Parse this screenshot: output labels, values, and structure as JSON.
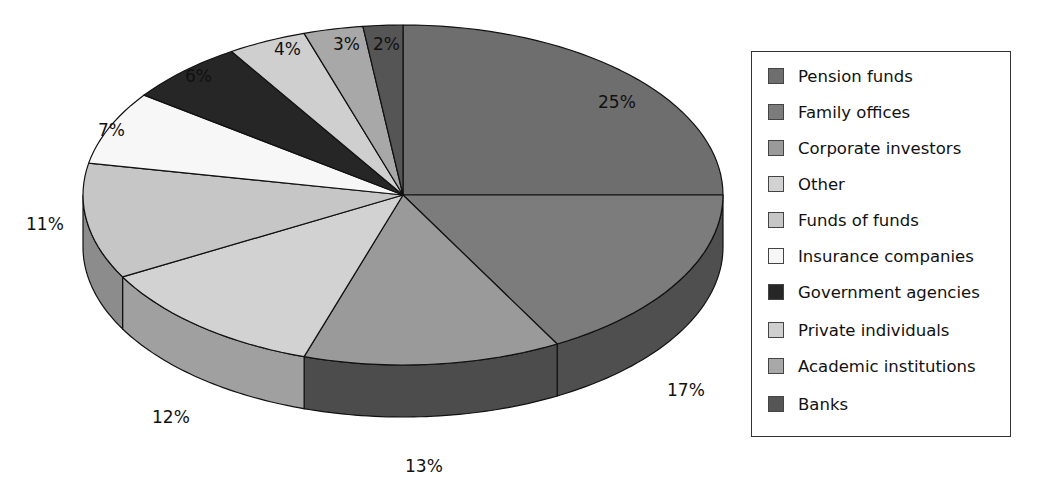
{
  "chart_data": {
    "type": "pie",
    "style": "3d",
    "title": "",
    "categories": [
      "Pension funds",
      "Family offices",
      "Corporate investors",
      "Other",
      "Funds of funds",
      "Insurance companies",
      "Government agencies",
      "Private individuals",
      "Academic institutions",
      "Banks"
    ],
    "values": [
      25,
      17,
      13,
      12,
      11,
      7,
      6,
      4,
      3,
      2
    ],
    "labels": [
      "25%",
      "17%",
      "13%",
      "12%",
      "11%",
      "7%",
      "6%",
      "4%",
      "3%",
      "2%"
    ],
    "colors": [
      "#6e6e6e",
      "#7c7c7c",
      "#9a9a9a",
      "#d2d2d2",
      "#c6c6c6",
      "#f7f7f7",
      "#262626",
      "#cfcfcf",
      "#a8a8a8",
      "#555555"
    ],
    "side_colors": [
      "#4a4a4a",
      "#4f4f4f",
      "#4c4c4c",
      "#a0a0a0",
      "#8c8c8c",
      "#cccccc",
      "#1a1a1a",
      "#a0a0a0",
      "#808080",
      "#3a3a3a"
    ],
    "legend_position": "right",
    "start_angle_deg": 90,
    "direction": "clockwise"
  },
  "legend": {
    "items": [
      {
        "label": "Pension funds",
        "color": "#6e6e6e"
      },
      {
        "label": "Family offices",
        "color": "#7c7c7c"
      },
      {
        "label": "Corporate investors",
        "color": "#9a9a9a"
      },
      {
        "label": "Other",
        "color": "#d2d2d2"
      },
      {
        "label": "Funds of funds",
        "color": "#c6c6c6"
      },
      {
        "label": "Insurance companies",
        "color": "#f7f7f7"
      },
      {
        "label": "Government agencies",
        "color": "#262626"
      },
      {
        "label": "Private individuals",
        "color": "#cfcfcf"
      },
      {
        "label": "Academic institutions",
        "color": "#a8a8a8"
      },
      {
        "label": "Banks",
        "color": "#555555"
      }
    ]
  },
  "slice_labels": [
    {
      "text": "25%",
      "x": 598,
      "y": 108
    },
    {
      "text": "17%",
      "x": 667,
      "y": 396
    },
    {
      "text": "13%",
      "x": 405,
      "y": 472
    },
    {
      "text": "12%",
      "x": 152,
      "y": 423
    },
    {
      "text": "11%",
      "x": 26,
      "y": 230
    },
    {
      "text": "7%",
      "x": 98,
      "y": 136
    },
    {
      "text": "6%",
      "x": 185,
      "y": 82
    },
    {
      "text": "4%",
      "x": 274,
      "y": 55
    },
    {
      "text": "3%",
      "x": 333,
      "y": 50
    },
    {
      "text": "2%",
      "x": 373,
      "y": 50
    }
  ]
}
